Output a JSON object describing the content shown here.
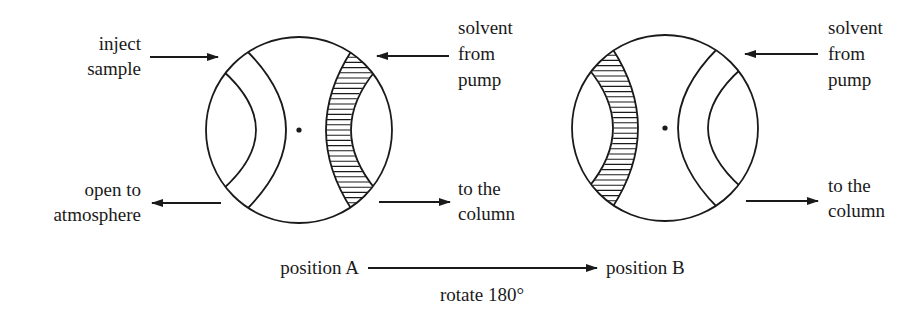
{
  "diagram": {
    "ink_color": "#1a1a1a",
    "background_color": "#ffffff",
    "position_a": {
      "name": "position A",
      "hatched_side": "right",
      "labels": {
        "inject_sample": [
          "inject",
          "sample"
        ],
        "open_to_atmosphere": [
          "open to",
          "atmosphere"
        ],
        "solvent_from_pump": [
          "solvent",
          "from",
          "pump"
        ],
        "to_the_column": [
          "to the",
          "column"
        ]
      }
    },
    "position_b": {
      "name": "position B",
      "hatched_side": "left",
      "labels": {
        "solvent_from_pump": [
          "solvent",
          "from",
          "pump"
        ],
        "to_the_column": [
          "to the",
          "column"
        ]
      }
    },
    "transition": {
      "from": "position A",
      "to": "position B",
      "caption": "rotate 180°"
    }
  }
}
